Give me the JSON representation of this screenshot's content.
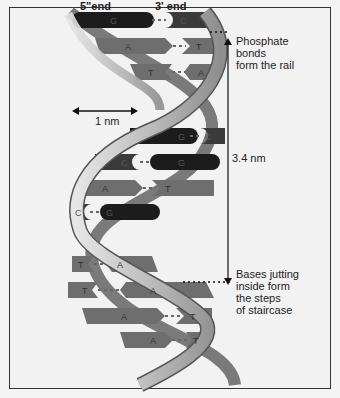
{
  "labels": {
    "five_end": "5\"end",
    "three_end": "3' end",
    "width": "1 nm",
    "pitch": "3.4 nm",
    "rail": [
      "Phosphate",
      "bonds",
      "form the rail"
    ],
    "steps": [
      "Bases jutting",
      "inside form",
      "the steps",
      "of staircase"
    ]
  },
  "base_pairs": [
    {
      "left": "G",
      "right": "C"
    },
    {
      "left": "A",
      "right": "T"
    },
    {
      "left": "T",
      "right": "A"
    },
    {
      "left": "G",
      "right": "C"
    },
    {
      "left": "C",
      "right": "G"
    },
    {
      "left": "A",
      "right": "T"
    },
    {
      "left": "C",
      "right": "G"
    },
    {
      "left": "T",
      "right": "A"
    },
    {
      "left": "T",
      "right": "A"
    },
    {
      "left": "A",
      "right": "T"
    },
    {
      "left": "A",
      "right": "T"
    }
  ],
  "colors": {
    "dark": "#1c1c1c",
    "mid": "#6e6e6e",
    "strand": "#c8c8c8",
    "strand_edge": "#555"
  }
}
